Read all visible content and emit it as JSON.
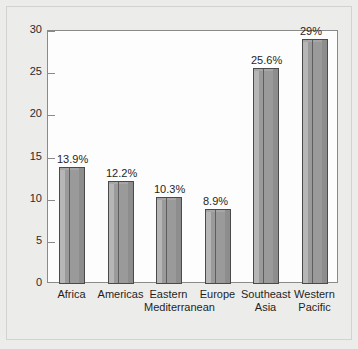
{
  "chart_data": {
    "type": "bar",
    "title": "",
    "subtitle": "",
    "xlabel": "",
    "ylabel": "",
    "categories": [
      "Africa",
      "Eastern Mediterranean",
      "Americas",
      "Europe",
      "Southeast Asia",
      "Western Pacific"
    ],
    "bars": [
      {
        "line1": "Africa",
        "line2": "",
        "value": 13.9,
        "label": "13.9%"
      },
      {
        "line1": "Americas",
        "line2": "",
        "value": 12.2,
        "label": "12.2%"
      },
      {
        "line1": "Eastern",
        "line2": "Mediterranean",
        "value": 10.3,
        "label": "10.3%"
      },
      {
        "line1": "Europe",
        "line2": "",
        "value": 8.9,
        "label": "8.9%"
      },
      {
        "line1": "Southeast",
        "line2": "Asia",
        "value": 25.6,
        "label": "25.6%"
      },
      {
        "line1": "Western",
        "line2": "Pacific",
        "value": 29.0,
        "label": "29%"
      }
    ],
    "values": [
      13.9,
      12.2,
      10.3,
      8.9,
      25.6,
      29.0
    ],
    "data_labels": [
      "13.9%",
      "12.2%",
      "10.3%",
      "8.9%",
      "25.6%",
      "29%"
    ],
    "ylim": [
      0,
      30
    ],
    "ytick_values": [
      0,
      5,
      10,
      15,
      20,
      25,
      30
    ],
    "ytick_labels": [
      "0",
      "5",
      "10",
      "15",
      "20",
      "25",
      "30"
    ],
    "grid": false,
    "legend": null,
    "bar_color": "#9a9a9a",
    "bar_edge_color": "#4a4a4a",
    "plot_background": "#fdfdfd",
    "figure_background": "#ececea",
    "axis_color": "#8a8a8a",
    "text_color": "#1f1f1f"
  }
}
